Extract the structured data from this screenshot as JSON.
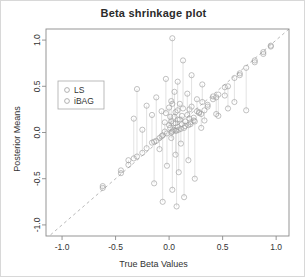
{
  "chart_data": {
    "type": "scatter",
    "title": "Beta shrinkage plot",
    "xlabel": "True Beta Values",
    "ylabel": "Posterior Means",
    "xlim": [
      -1.15,
      1.12
    ],
    "ylim": [
      -1.12,
      1.12
    ],
    "xticks": [
      -1.0,
      -0.5,
      0.0,
      0.5,
      1.0
    ],
    "xticklabels": [
      "-1.0",
      "-0.5",
      "0.0",
      "0.5",
      "1.0"
    ],
    "yticks": [
      -1.0,
      -0.5,
      0.0,
      0.5,
      1.0
    ],
    "yticklabels": [
      "-1.0",
      "-0.5",
      "0.0",
      "0.5",
      "1.0"
    ],
    "grid": false,
    "legend_position": "upper-left",
    "reference_line": {
      "type": "identity",
      "style": "dashed",
      "color": "#b0b0b0",
      "from": [
        -1.15,
        -1.15
      ],
      "to": [
        1.12,
        1.12
      ]
    },
    "marker": {
      "shape": "open-circle",
      "color": "#9a9a9a"
    },
    "legend": [
      {
        "name": "LS",
        "marker": "open-circle",
        "color": "#9a9a9a"
      },
      {
        "name": "iBAG",
        "marker": "open-circle",
        "color": "#9a9a9a"
      }
    ],
    "series": [
      {
        "name": "LS",
        "points": [
          [
            0.03,
            1.02
          ],
          [
            0.13,
            0.78
          ],
          [
            0.21,
            0.62
          ],
          [
            -0.03,
            0.58
          ],
          [
            0.08,
            0.55
          ],
          [
            0.31,
            0.52
          ],
          [
            -0.3,
            0.47
          ],
          [
            0.05,
            0.44
          ],
          [
            0.17,
            0.42
          ],
          [
            0.52,
            0.4
          ],
          [
            -0.12,
            0.38
          ],
          [
            0.26,
            0.36
          ],
          [
            0.02,
            0.34
          ],
          [
            0.61,
            0.33
          ],
          [
            0.1,
            0.31
          ],
          [
            -0.21,
            0.29
          ],
          [
            0.36,
            0.28
          ],
          [
            0.0,
            0.27
          ],
          [
            0.19,
            0.25
          ],
          [
            0.72,
            0.24
          ],
          [
            -0.07,
            0.23
          ],
          [
            0.06,
            0.22
          ],
          [
            0.28,
            0.21
          ],
          [
            0.44,
            0.2
          ],
          [
            -0.16,
            0.19
          ],
          [
            0.12,
            0.18
          ],
          [
            0.01,
            0.17
          ],
          [
            0.23,
            0.16
          ],
          [
            -0.33,
            0.15
          ],
          [
            0.08,
            0.14
          ],
          [
            0.33,
            0.13
          ],
          [
            0.15,
            0.12
          ],
          [
            -0.04,
            0.11
          ],
          [
            0.04,
            0.1
          ],
          [
            0.2,
            0.09
          ],
          [
            0.88,
            0.87
          ],
          [
            0.66,
            0.64
          ],
          [
            0.41,
            0.39
          ],
          [
            -0.45,
            -0.41
          ],
          [
            -0.62,
            -0.58
          ],
          [
            0.02,
            -0.06
          ],
          [
            0.11,
            -0.12
          ],
          [
            -0.09,
            -0.18
          ],
          [
            0.06,
            -0.24
          ],
          [
            0.18,
            -0.3
          ],
          [
            -0.02,
            -0.36
          ],
          [
            0.09,
            -0.43
          ],
          [
            0.24,
            -0.5
          ],
          [
            -0.14,
            -0.55
          ],
          [
            0.03,
            -0.62
          ],
          [
            0.14,
            -0.7
          ],
          [
            -0.06,
            -0.75
          ],
          [
            0.07,
            -0.8
          ],
          [
            0.3,
            0.05
          ],
          [
            -0.25,
            0.03
          ],
          [
            0.46,
            0.18
          ],
          [
            0.55,
            0.26
          ],
          [
            -0.38,
            -0.3
          ],
          [
            0.8,
            0.76
          ],
          [
            0.95,
            0.93
          ]
        ]
      },
      {
        "name": "iBAG",
        "points": [
          [
            0.03,
            0.31
          ],
          [
            0.13,
            0.26
          ],
          [
            0.21,
            0.28
          ],
          [
            -0.03,
            0.21
          ],
          [
            0.08,
            0.24
          ],
          [
            0.31,
            0.33
          ],
          [
            -0.3,
            -0.26
          ],
          [
            0.05,
            0.17
          ],
          [
            0.17,
            0.19
          ],
          [
            0.52,
            0.49
          ],
          [
            -0.12,
            -0.09
          ],
          [
            0.26,
            0.23
          ],
          [
            0.02,
            0.12
          ],
          [
            0.61,
            0.59
          ],
          [
            0.1,
            0.14
          ],
          [
            -0.21,
            -0.17
          ],
          [
            0.36,
            0.3
          ],
          [
            0.0,
            0.08
          ],
          [
            0.19,
            0.15
          ],
          [
            0.72,
            0.7
          ],
          [
            -0.07,
            -0.04
          ],
          [
            0.06,
            0.1
          ],
          [
            0.28,
            0.22
          ],
          [
            0.44,
            0.38
          ],
          [
            -0.16,
            -0.11
          ],
          [
            0.12,
            0.09
          ],
          [
            0.01,
            0.05
          ],
          [
            0.23,
            0.13
          ],
          [
            -0.33,
            -0.28
          ],
          [
            0.08,
            0.06
          ],
          [
            0.33,
            0.24
          ],
          [
            0.15,
            0.07
          ],
          [
            -0.04,
            0.01
          ],
          [
            0.04,
            0.03
          ],
          [
            0.2,
            0.11
          ],
          [
            0.88,
            0.85
          ],
          [
            0.66,
            0.62
          ],
          [
            0.41,
            0.36
          ],
          [
            -0.45,
            -0.44
          ],
          [
            -0.62,
            -0.6
          ],
          [
            0.02,
            0.0
          ],
          [
            0.11,
            0.04
          ],
          [
            -0.09,
            -0.06
          ],
          [
            0.06,
            0.02
          ],
          [
            0.18,
            0.08
          ],
          [
            -0.02,
            -0.01
          ],
          [
            0.09,
            0.03
          ],
          [
            0.24,
            0.12
          ],
          [
            -0.14,
            -0.1
          ],
          [
            0.03,
            0.01
          ],
          [
            0.14,
            0.05
          ],
          [
            -0.06,
            -0.03
          ],
          [
            0.07,
            0.02
          ],
          [
            0.3,
            0.2
          ],
          [
            -0.25,
            -0.22
          ],
          [
            0.46,
            0.41
          ],
          [
            0.55,
            0.5
          ],
          [
            -0.38,
            -0.35
          ],
          [
            0.8,
            0.78
          ],
          [
            0.95,
            0.94
          ]
        ]
      }
    ]
  }
}
